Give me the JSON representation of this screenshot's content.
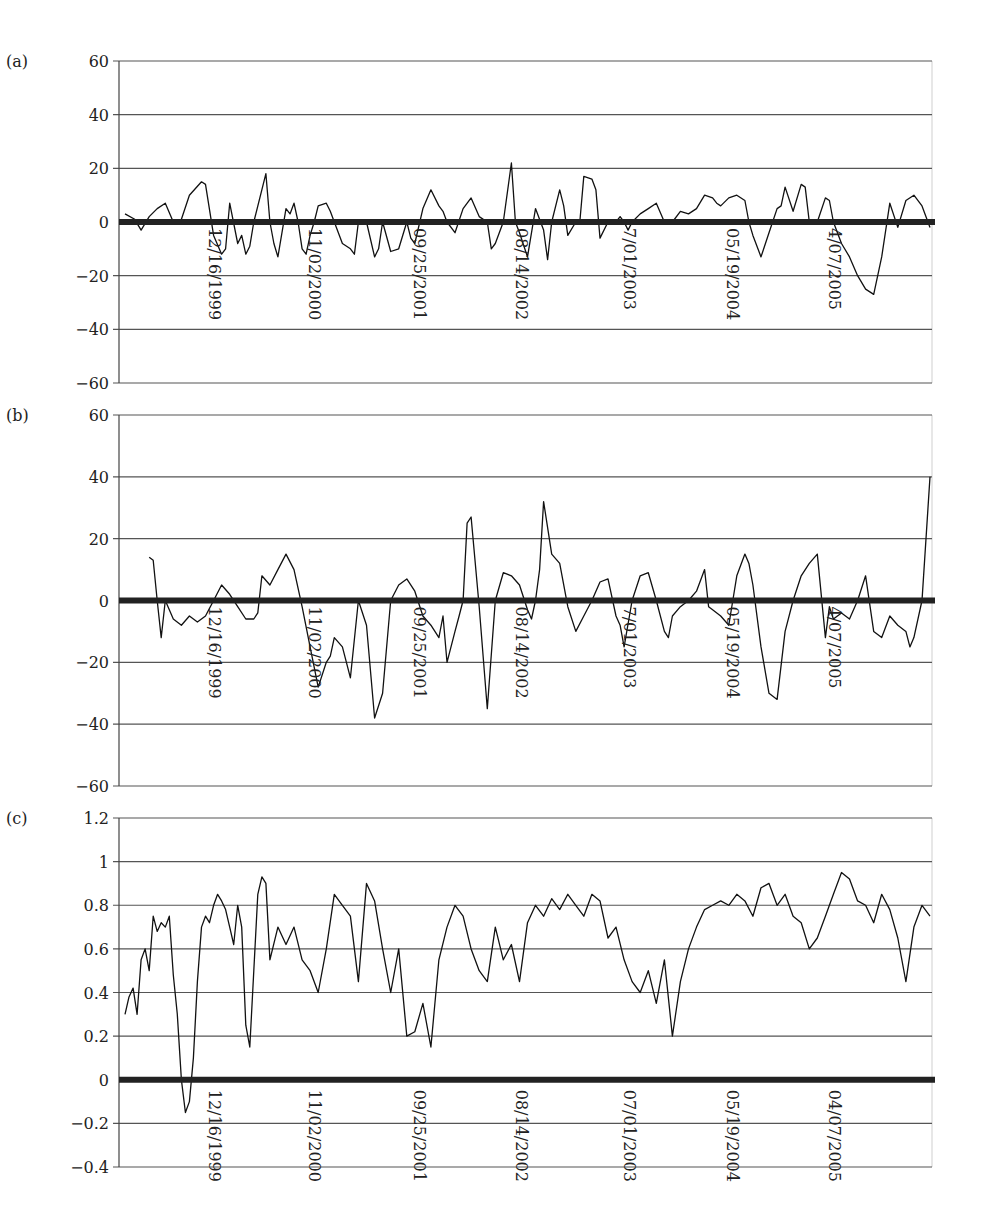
{
  "figure": {
    "panel_labels": [
      "(a)",
      "(b)",
      "(c)"
    ]
  },
  "chart_data": [
    {
      "type": "line",
      "panel": "(a)",
      "title": "",
      "xlabel": "",
      "ylabel": "",
      "ylim": [
        -60,
        60
      ],
      "yticks": [
        60,
        40,
        20,
        0,
        -20,
        -40,
        -60
      ],
      "grid": true,
      "legend": null,
      "x_tick_labels": [
        "12/16/1999",
        "11/02/2000",
        "09/25/2001",
        "08/14/2002",
        "7/01/2003",
        "05/19/2004",
        "4/07/2005"
      ],
      "x_tick_label_placement": "at zero line, rotated 90°",
      "zero_line": "bold",
      "series": [
        {
          "name": "panel-a-series",
          "x": [
            0.0,
            0.012,
            0.02,
            0.03,
            0.04,
            0.05,
            0.06,
            0.07,
            0.08,
            0.095,
            0.1,
            0.11,
            0.12,
            0.125,
            0.13,
            0.14,
            0.145,
            0.15,
            0.155,
            0.16,
            0.175,
            0.18,
            0.185,
            0.19,
            0.2,
            0.205,
            0.21,
            0.215,
            0.22,
            0.225,
            0.23,
            0.235,
            0.24,
            0.25,
            0.255,
            0.26,
            0.27,
            0.28,
            0.285,
            0.29,
            0.3,
            0.31,
            0.315,
            0.32,
            0.33,
            0.33,
            0.34,
            0.35,
            0.355,
            0.36,
            0.37,
            0.38,
            0.39,
            0.395,
            0.4,
            0.41,
            0.42,
            0.43,
            0.44,
            0.45,
            0.455,
            0.46,
            0.47,
            0.48,
            0.485,
            0.49,
            0.5,
            0.51,
            0.52,
            0.525,
            0.53,
            0.54,
            0.545,
            0.55,
            0.56,
            0.565,
            0.57,
            0.58,
            0.585,
            0.59,
            0.6,
            0.61,
            0.615,
            0.62,
            0.625,
            0.63,
            0.64,
            0.65,
            0.66,
            0.67,
            0.68,
            0.69,
            0.7,
            0.71,
            0.72,
            0.73,
            0.735,
            0.74,
            0.75,
            0.76,
            0.77,
            0.775,
            0.78,
            0.79,
            0.8,
            0.81,
            0.815,
            0.82,
            0.83,
            0.84,
            0.845,
            0.85,
            0.86,
            0.87,
            0.875,
            0.88,
            0.89,
            0.9,
            0.91,
            0.92,
            0.93,
            0.94,
            0.95,
            0.96,
            0.97,
            0.98,
            0.99,
            1.0
          ],
          "values": [
            3,
            1,
            -3,
            2,
            5,
            7,
            0,
            1,
            10,
            15,
            14,
            -5,
            -12,
            -10,
            7,
            -8,
            -5,
            -12,
            -9,
            0,
            18,
            0,
            -8,
            -13,
            5,
            3,
            7,
            0,
            -10,
            -12,
            -5,
            0,
            6,
            7,
            4,
            0,
            -8,
            -10,
            -12,
            0,
            0,
            -13,
            -10,
            0,
            -11,
            -11,
            -10,
            0,
            -6,
            -8,
            5,
            12,
            6,
            4,
            0,
            -4,
            5,
            9,
            2,
            0,
            -10,
            -8,
            0,
            22,
            0,
            -4,
            -13,
            5,
            -3,
            -14,
            0,
            12,
            6,
            -5,
            0,
            0,
            17,
            16,
            12,
            -6,
            0,
            0,
            2,
            0,
            -3,
            0,
            3,
            5,
            7,
            0,
            0,
            4,
            3,
            5,
            10,
            9,
            7,
            6,
            9,
            10,
            8,
            0,
            -5,
            -13,
            -4,
            5,
            6,
            13,
            4,
            14,
            13,
            0,
            0,
            9,
            8,
            0,
            -8,
            -13,
            -20,
            -25,
            -27,
            -13,
            7,
            -2,
            8,
            10,
            6,
            -2,
            -10,
            0,
            0,
            12,
            15,
            16
          ]
        }
      ]
    },
    {
      "type": "line",
      "panel": "(b)",
      "title": "",
      "xlabel": "",
      "ylabel": "",
      "ylim": [
        -60,
        60
      ],
      "yticks": [
        60,
        40,
        20,
        0,
        -20,
        -40,
        -60
      ],
      "grid": true,
      "legend": null,
      "x_tick_labels": [
        "12/16/1999",
        "11/02/2000",
        "09/25/2001",
        "08/14/2002",
        "7/01/2003",
        "05/19/2004",
        "4/07/2005"
      ],
      "x_tick_label_placement": "at zero line, rotated 90°",
      "zero_line": "bold",
      "series": [
        {
          "name": "panel-b-series",
          "x": [
            0.03,
            0.035,
            0.04,
            0.045,
            0.05,
            0.06,
            0.07,
            0.08,
            0.09,
            0.1,
            0.11,
            0.12,
            0.13,
            0.14,
            0.15,
            0.16,
            0.165,
            0.17,
            0.18,
            0.19,
            0.2,
            0.21,
            0.22,
            0.23,
            0.24,
            0.25,
            0.255,
            0.26,
            0.27,
            0.28,
            0.29,
            0.3,
            0.31,
            0.32,
            0.33,
            0.34,
            0.35,
            0.36,
            0.37,
            0.38,
            0.39,
            0.395,
            0.4,
            0.41,
            0.415,
            0.42,
            0.425,
            0.43,
            0.44,
            0.45,
            0.46,
            0.47,
            0.48,
            0.49,
            0.5,
            0.505,
            0.51,
            0.515,
            0.52,
            0.53,
            0.54,
            0.55,
            0.56,
            0.57,
            0.58,
            0.59,
            0.6,
            0.61,
            0.615,
            0.62,
            0.63,
            0.64,
            0.65,
            0.66,
            0.67,
            0.675,
            0.68,
            0.69,
            0.7,
            0.71,
            0.72,
            0.725,
            0.73,
            0.74,
            0.75,
            0.755,
            0.76,
            0.77,
            0.775,
            0.78,
            0.79,
            0.8,
            0.81,
            0.82,
            0.83,
            0.84,
            0.85,
            0.86,
            0.87,
            0.875,
            0.88,
            0.89,
            0.9,
            0.91,
            0.92,
            0.93,
            0.94,
            0.95,
            0.96,
            0.97,
            0.975,
            0.98,
            0.99,
            1.0
          ],
          "values": [
            14,
            13,
            0,
            -12,
            0,
            -6,
            -8,
            -5,
            -7,
            -5,
            0,
            5,
            2,
            -2,
            -6,
            -6,
            -4,
            8,
            5,
            10,
            15,
            10,
            -2,
            -15,
            -28,
            -20,
            -18,
            -12,
            -15,
            -25,
            0,
            -8,
            -38,
            -30,
            0,
            5,
            7,
            3,
            -5,
            -8,
            -12,
            -5,
            -20,
            -10,
            -5,
            0,
            25,
            27,
            -2,
            -35,
            0,
            9,
            8,
            5,
            -3,
            -6,
            0,
            10,
            32,
            15,
            12,
            -2,
            -10,
            -5,
            0,
            6,
            7,
            -5,
            -8,
            -15,
            0,
            8,
            9,
            0,
            -10,
            -12,
            -5,
            -2,
            0,
            3,
            10,
            -2,
            -3,
            -5,
            -8,
            0,
            8,
            15,
            12,
            5,
            -15,
            -30,
            -32,
            -10,
            0,
            8,
            12,
            15,
            -12,
            -2,
            -6,
            -4,
            -6,
            0,
            8,
            -10,
            -12,
            -5,
            -8,
            -10,
            -15,
            -12,
            0,
            40,
            47,
            0,
            10,
            13,
            7
          ]
        }
      ]
    },
    {
      "type": "line",
      "panel": "(c)",
      "title": "",
      "xlabel": "",
      "ylabel": "",
      "ylim": [
        -0.4,
        1.2
      ],
      "yticks": [
        1.2,
        1,
        0.8,
        0.6,
        0.4,
        0.2,
        0,
        -0.2,
        -0.4
      ],
      "grid": true,
      "legend": null,
      "x_tick_labels": [
        "12/16/1999",
        "11/02/2000",
        "09/25/2001",
        "08/14/2002",
        "07/01/2003",
        "05/19/2004",
        "04/07/2005"
      ],
      "x_tick_label_placement": "below zero line, rotated 90°",
      "zero_line": "bold",
      "series": [
        {
          "name": "panel-c-series",
          "x": [
            0.0,
            0.005,
            0.01,
            0.015,
            0.02,
            0.025,
            0.03,
            0.035,
            0.04,
            0.045,
            0.05,
            0.055,
            0.06,
            0.065,
            0.07,
            0.075,
            0.08,
            0.085,
            0.09,
            0.095,
            0.1,
            0.105,
            0.11,
            0.115,
            0.12,
            0.125,
            0.13,
            0.135,
            0.14,
            0.145,
            0.15,
            0.155,
            0.16,
            0.165,
            0.17,
            0.175,
            0.18,
            0.19,
            0.2,
            0.21,
            0.22,
            0.23,
            0.24,
            0.25,
            0.26,
            0.27,
            0.28,
            0.29,
            0.3,
            0.31,
            0.32,
            0.33,
            0.34,
            0.35,
            0.36,
            0.37,
            0.38,
            0.39,
            0.4,
            0.41,
            0.42,
            0.43,
            0.44,
            0.45,
            0.46,
            0.47,
            0.48,
            0.49,
            0.5,
            0.51,
            0.52,
            0.53,
            0.54,
            0.55,
            0.56,
            0.57,
            0.58,
            0.59,
            0.6,
            0.61,
            0.62,
            0.63,
            0.64,
            0.65,
            0.66,
            0.67,
            0.68,
            0.69,
            0.7,
            0.71,
            0.72,
            0.73,
            0.74,
            0.75,
            0.76,
            0.77,
            0.78,
            0.79,
            0.8,
            0.81,
            0.82,
            0.83,
            0.84,
            0.85,
            0.86,
            0.87,
            0.88,
            0.89,
            0.9,
            0.91,
            0.92,
            0.93,
            0.94,
            0.95,
            0.96,
            0.97,
            0.98,
            0.99,
            1.0
          ],
          "values": [
            0.3,
            0.38,
            0.42,
            0.3,
            0.55,
            0.6,
            0.5,
            0.75,
            0.68,
            0.72,
            0.7,
            0.75,
            0.48,
            0.3,
            0.0,
            -0.15,
            -0.1,
            0.1,
            0.45,
            0.7,
            0.75,
            0.72,
            0.8,
            0.85,
            0.82,
            0.78,
            0.7,
            0.62,
            0.8,
            0.7,
            0.25,
            0.15,
            0.5,
            0.85,
            0.93,
            0.9,
            0.55,
            0.7,
            0.62,
            0.7,
            0.55,
            0.5,
            0.4,
            0.6,
            0.85,
            0.8,
            0.75,
            0.45,
            0.9,
            0.82,
            0.6,
            0.4,
            0.6,
            0.2,
            0.22,
            0.35,
            0.15,
            0.55,
            0.7,
            0.8,
            0.75,
            0.6,
            0.5,
            0.45,
            0.7,
            0.55,
            0.62,
            0.45,
            0.72,
            0.8,
            0.75,
            0.83,
            0.78,
            0.85,
            0.8,
            0.75,
            0.85,
            0.82,
            0.65,
            0.7,
            0.55,
            0.45,
            0.4,
            0.5,
            0.35,
            0.55,
            0.2,
            0.45,
            0.6,
            0.7,
            0.78,
            0.8,
            0.82,
            0.8,
            0.85,
            0.82,
            0.75,
            0.88,
            0.9,
            0.8,
            0.85,
            0.75,
            0.72,
            0.6,
            0.65,
            0.75,
            0.85,
            0.95,
            0.92,
            0.82,
            0.8,
            0.72,
            0.85,
            0.78,
            0.65,
            0.45,
            0.7,
            0.8,
            0.75,
            0.85,
            0.9
          ]
        }
      ]
    }
  ]
}
